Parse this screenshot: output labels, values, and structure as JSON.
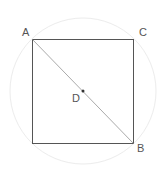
{
  "diagram": {
    "type": "geometry",
    "points": [
      {
        "label": "A",
        "x": 32,
        "y": 39,
        "role": "top-left vertex"
      },
      {
        "label": "C",
        "x": 134,
        "y": 39,
        "role": "top-right vertex"
      },
      {
        "label": "B",
        "x": 134,
        "y": 143,
        "role": "bottom-right vertex"
      },
      {
        "label": "D",
        "x": 83,
        "y": 91,
        "role": "center"
      }
    ],
    "labels": {
      "a": "A",
      "b": "B",
      "c": "C",
      "d": "D"
    },
    "square": {
      "x": 32,
      "y": 39,
      "size": 102,
      "stroke": "#555555"
    },
    "diagonal": {
      "from": "A",
      "to": "B",
      "stroke": "#aaaaaa"
    },
    "circle": {
      "cx": 83,
      "cy": 91,
      "r": 73,
      "stroke": "#ececec"
    },
    "center_dot": {
      "color": "#333333",
      "r": 1.5
    }
  }
}
